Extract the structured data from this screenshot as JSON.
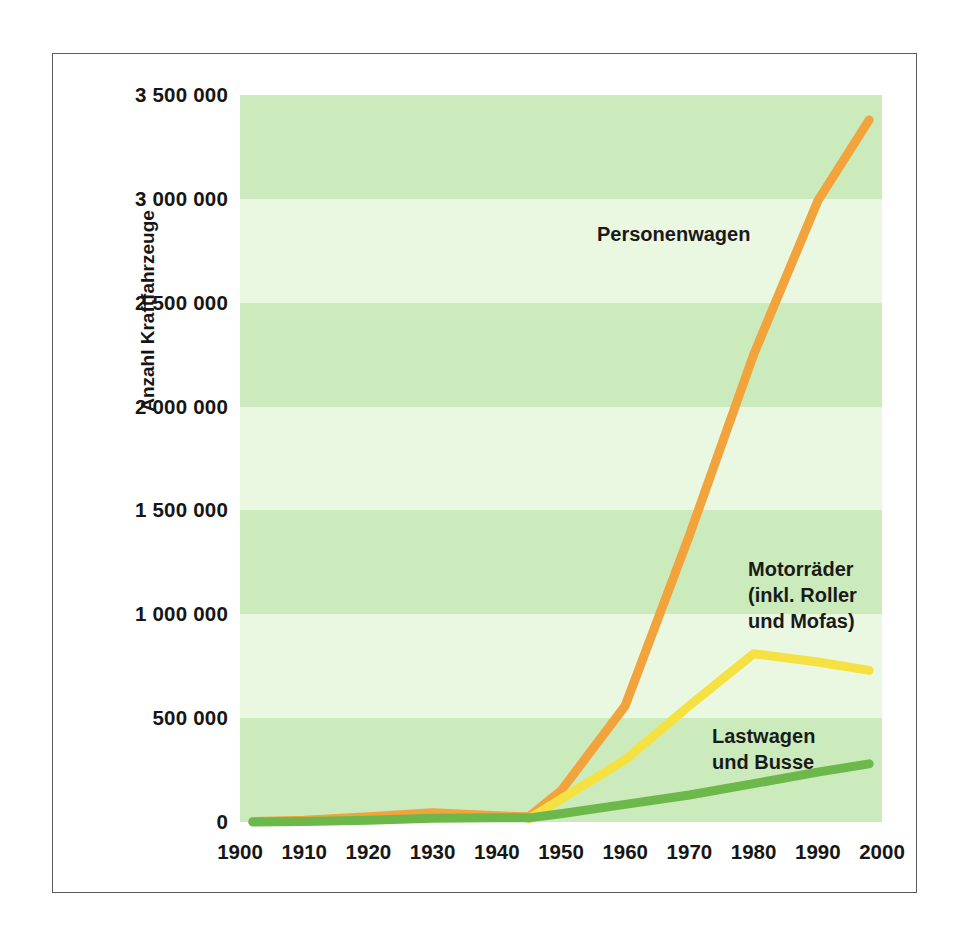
{
  "chart_data": {
    "type": "line",
    "title": "",
    "xlabel": "",
    "ylabel": "Anzahl Kraftfahrzeuge",
    "xlim": [
      1900,
      2000
    ],
    "ylim": [
      0,
      3500000
    ],
    "grid": "horizontal-bands",
    "legend_position": "inline-annotations",
    "xticks": [
      "1900",
      "1910",
      "1920",
      "1930",
      "1940",
      "1950",
      "1960",
      "1970",
      "1980",
      "1990",
      "2000"
    ],
    "xtick_values": [
      1900,
      1910,
      1920,
      1930,
      1940,
      1950,
      1960,
      1970,
      1980,
      1990,
      2000
    ],
    "yticks": [
      "0",
      "500 000",
      "1 000 000",
      "1 500 000",
      "2 000 000",
      "2 500 000",
      "3 000 000",
      "3 500 000"
    ],
    "ytick_values": [
      0,
      500000,
      1000000,
      1500000,
      2000000,
      2500000,
      3000000,
      3500000
    ],
    "series": [
      {
        "name": "Personenwagen",
        "color": "#F2A33C",
        "x": [
          1902,
          1910,
          1920,
          1930,
          1940,
          1945,
          1950,
          1960,
          1970,
          1980,
          1990,
          1998
        ],
        "values": [
          2000,
          8000,
          25000,
          45000,
          30000,
          25000,
          150000,
          560000,
          1380000,
          2250000,
          2990000,
          3380000
        ]
      },
      {
        "name": "Motorräder (inkl. Roller und Mofas)",
        "color": "#F5E242",
        "x": [
          1945,
          1950,
          1960,
          1970,
          1980,
          1990,
          1998
        ],
        "values": [
          15000,
          110000,
          300000,
          560000,
          810000,
          770000,
          730000
        ]
      },
      {
        "name": "Lastwagen und Busse",
        "color": "#6CB84A",
        "x": [
          1902,
          1910,
          1920,
          1930,
          1940,
          1945,
          1950,
          1960,
          1970,
          1980,
          1990,
          1998
        ],
        "values": [
          0,
          2000,
          8000,
          18000,
          20000,
          20000,
          40000,
          85000,
          130000,
          185000,
          240000,
          280000
        ]
      }
    ],
    "annotations": [
      {
        "text": "Personenwagen",
        "series": "Personenwagen"
      },
      {
        "text": "Motorräder\n(inkl. Roller\nund Mofas)",
        "series": "Motorräder (inkl. Roller und Mofas)"
      },
      {
        "text": "Lastwagen\nund Busse",
        "series": "Lastwagen und Busse"
      }
    ],
    "band_colors": {
      "dark": "#CCEBBC",
      "light": "#EAF7E1"
    },
    "frame_color": "#5a5a5a",
    "background": "#ffffff"
  }
}
